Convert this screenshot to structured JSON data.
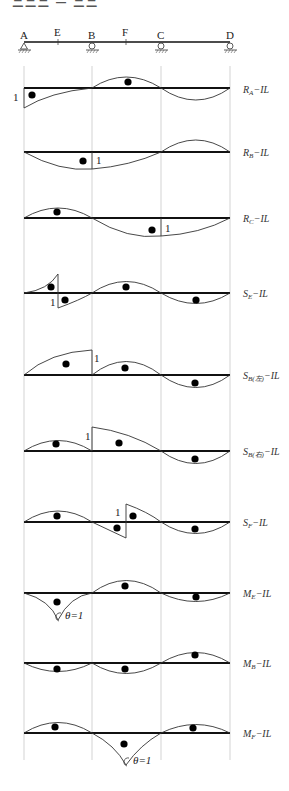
{
  "header": {
    "title_fragment": "ΞΞΞ – ΞΞ"
  },
  "beam": {
    "points": [
      {
        "name": "A",
        "x": 24,
        "support": "pin"
      },
      {
        "name": "E",
        "x": 58,
        "support": "none"
      },
      {
        "name": "B",
        "x": 92,
        "support": "roller"
      },
      {
        "name": "F",
        "x": 126,
        "support": "none"
      },
      {
        "name": "C",
        "x": 161,
        "support": "roller"
      },
      {
        "name": "D",
        "x": 230,
        "support": "roller"
      }
    ]
  },
  "diagrams": [
    {
      "id": "RA",
      "label_main": "R",
      "label_sub": "A",
      "label_suffix": "−IL",
      "baseline_y": 88,
      "annotation": "1",
      "signs": [
        "+",
        "−"
      ]
    },
    {
      "id": "RB",
      "label_main": "R",
      "label_sub": "B",
      "label_suffix": "−IL",
      "baseline_y": 152,
      "annotation": "1",
      "signs": [
        "+"
      ]
    },
    {
      "id": "RC",
      "label_main": "R",
      "label_sub": "C",
      "label_suffix": "−IL",
      "baseline_y": 218,
      "annotation": "1",
      "signs": [
        "−",
        "+"
      ]
    },
    {
      "id": "SE",
      "label_main": "S",
      "label_sub": "E",
      "label_suffix": "−IL",
      "baseline_y": 293,
      "annotation": "1",
      "signs": [
        "−",
        "+",
        "−",
        "+"
      ]
    },
    {
      "id": "SBL",
      "label_main": "S",
      "label_sub": "B(左)",
      "label_suffix": "−IL",
      "baseline_y": 375,
      "annotation": "1",
      "signs": [
        "−",
        "−",
        "+"
      ]
    },
    {
      "id": "SBR",
      "label_main": "S",
      "label_sub": "B(右)",
      "label_suffix": "−IL",
      "baseline_y": 451,
      "annotation": "1",
      "signs": [
        "−",
        "+",
        "−"
      ]
    },
    {
      "id": "SF",
      "label_main": "S",
      "label_sub": "F",
      "label_suffix": "−IL",
      "baseline_y": 522,
      "annotation": "1",
      "signs": [
        "−",
        "+",
        "−",
        "+"
      ]
    },
    {
      "id": "ME",
      "label_main": "M",
      "label_sub": "E",
      "label_suffix": "−IL",
      "baseline_y": 593,
      "annotation": "θ=1",
      "signs": [
        "+",
        "−",
        "+"
      ]
    },
    {
      "id": "MB",
      "label_main": "M",
      "label_sub": "B",
      "label_suffix": "−IL",
      "baseline_y": 663,
      "annotation": "",
      "signs": [
        "−",
        "−",
        "+"
      ]
    },
    {
      "id": "MF",
      "label_main": "M",
      "label_sub": "F",
      "label_suffix": "−IL",
      "baseline_y": 733,
      "annotation": "θ=1",
      "signs": [
        "+",
        "−",
        "+"
      ]
    }
  ],
  "colors": {
    "line": "#111111",
    "curve": "#333333",
    "guide": "#c8c8c8"
  }
}
